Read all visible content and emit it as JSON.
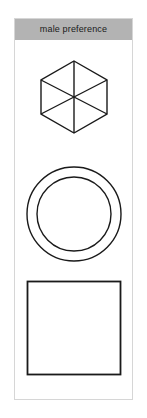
{
  "panel": {
    "header": {
      "label": "male preference",
      "background_color": "#b3b3b3",
      "text_color": "#1a1a1a"
    },
    "border_color": "#d6d6d6",
    "background_color": "#ffffff"
  },
  "shapes": [
    {
      "name": "hexagon-divided",
      "type": "hexagon",
      "orientation": "pointy-top",
      "sectors": 6,
      "divider_lines": 3,
      "stroke_color": "#1a1a1a",
      "fill_color": "none",
      "stroke_width": 1.4,
      "width": 68,
      "height": 74
    },
    {
      "name": "concentric-ring",
      "type": "annulus",
      "circles": 2,
      "outer_diameter": 94,
      "inner_diameter": 74,
      "stroke_color": "#1a1a1a",
      "fill_color": "none",
      "stroke_width": 1.4
    },
    {
      "name": "square-outline",
      "type": "square",
      "side": 92,
      "stroke_color": "#1a1a1a",
      "fill_color": "none",
      "stroke_width": 1.8
    }
  ]
}
